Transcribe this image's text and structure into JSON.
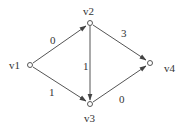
{
  "diagram": {
    "type": "directed-weighted-graph",
    "nodes": [
      {
        "id": "v1",
        "label": "v1",
        "x": 30,
        "y": 65
      },
      {
        "id": "v2",
        "label": "v2",
        "x": 90,
        "y": 23
      },
      {
        "id": "v3",
        "label": "v3",
        "x": 90,
        "y": 104
      },
      {
        "id": "v4",
        "label": "v4",
        "x": 150,
        "y": 63
      }
    ],
    "edges": [
      {
        "from": "v1",
        "to": "v2",
        "weight": "0"
      },
      {
        "from": "v1",
        "to": "v3",
        "weight": "1"
      },
      {
        "from": "v2",
        "to": "v3",
        "weight": "1"
      },
      {
        "from": "v2",
        "to": "v4",
        "weight": "3"
      },
      {
        "from": "v3",
        "to": "v4",
        "weight": "0"
      }
    ],
    "colors": {
      "line": "#555555",
      "text": "#333333",
      "background": "#ffffff"
    }
  }
}
